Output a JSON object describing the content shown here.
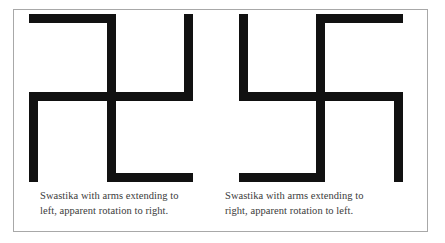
{
  "figure": {
    "panel_border_color": "#a8a8a8",
    "background_color": "#ffffff",
    "stroke_color": "#111111",
    "caption_color": "#3b3b3b",
    "items": [
      {
        "name": "swastika-left-arms",
        "icon": "swastika-left-facing-icon",
        "caption_line_1": "Swastika with arms extending to",
        "caption_line_2": "left, apparent rotation to right."
      },
      {
        "name": "swastika-right-arms",
        "icon": "swastika-right-facing-icon",
        "caption_line_1": "Swastika with arms extending to",
        "caption_line_2": "right, apparent rotation to left."
      }
    ]
  }
}
